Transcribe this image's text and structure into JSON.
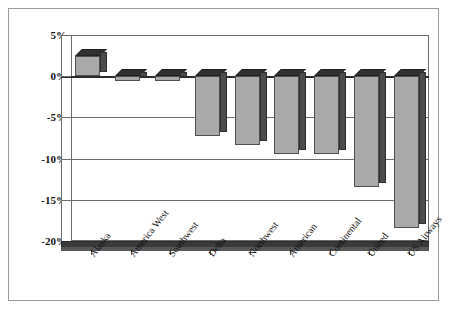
{
  "chart_data": {
    "type": "bar",
    "title": "",
    "subtitle": "",
    "xlabel": "",
    "ylabel": "",
    "categories": [
      "Alaska",
      "America West",
      "Southwest",
      "Delta",
      "Northwest",
      "American",
      "Continental",
      "United",
      "US Airways"
    ],
    "values": [
      2.5,
      -0.6,
      -0.6,
      -7.3,
      -8.4,
      -9.4,
      -9.4,
      -13.4,
      -18.4
    ],
    "ylim": [
      -20,
      5
    ],
    "ytick_labels": [
      "5%",
      "0%",
      "-5%",
      "-10%",
      "-15%",
      "-20%"
    ],
    "ytick_values": [
      5,
      0,
      -5,
      -10,
      -15,
      -20
    ],
    "grid": true,
    "legend": "none",
    "style": "3d-column",
    "colors": {
      "bar_front": "#a9a9a9",
      "bar_side": "#4c4c4c",
      "bar_top": "#303030",
      "gridline": "#6d6d6d",
      "axis_text": "#111111",
      "border": "#9a9a9a",
      "floor": "#3a3a3a",
      "background": "#ffffff"
    }
  }
}
